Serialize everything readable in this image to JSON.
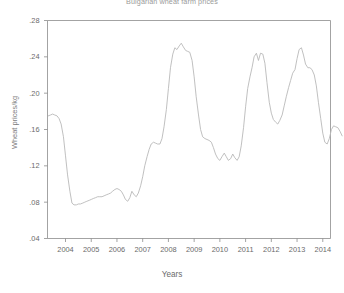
{
  "chart_data": {
    "type": "line",
    "title": "Bulgarian wheat farm prices",
    "xlabel": "Years",
    "ylabel": "Wheat prices/kg",
    "grid": false,
    "legend": false,
    "xlim": [
      2003.3,
      2014.3
    ],
    "ylim": [
      0.04,
      0.28
    ],
    "yticks": [
      0.04,
      0.08,
      0.12,
      0.16,
      0.2,
      0.24,
      0.28
    ],
    "ytick_labels": [
      ".04",
      ".08",
      ".12",
      ".16",
      ".20",
      ".24",
      ".28"
    ],
    "xticks": [
      2004,
      2005,
      2006,
      2007,
      2008,
      2009,
      2010,
      2011,
      2012,
      2013,
      2014
    ],
    "xtick_labels": [
      "2004",
      "2005",
      "2006",
      "2007",
      "2008",
      "2009",
      "2010",
      "2011",
      "2012",
      "2013",
      "2014"
    ],
    "line_color": "#b9b9b9",
    "axis_color": "#8c8c8c",
    "background": "#ffffff",
    "series": [
      {
        "name": "Wheat price per kg",
        "x": [
          2003.33,
          2003.42,
          2003.5,
          2003.58,
          2003.67,
          2003.75,
          2003.83,
          2003.92,
          2004.0,
          2004.08,
          2004.17,
          2004.25,
          2004.33,
          2004.42,
          2004.5,
          2004.58,
          2004.67,
          2004.75,
          2004.83,
          2004.92,
          2005.0,
          2005.08,
          2005.17,
          2005.25,
          2005.33,
          2005.42,
          2005.5,
          2005.58,
          2005.67,
          2005.75,
          2005.83,
          2005.92,
          2006.0,
          2006.08,
          2006.17,
          2006.25,
          2006.33,
          2006.42,
          2006.5,
          2006.58,
          2006.67,
          2006.75,
          2006.83,
          2006.92,
          2007.0,
          2007.08,
          2007.17,
          2007.25,
          2007.33,
          2007.42,
          2007.5,
          2007.58,
          2007.67,
          2007.75,
          2007.83,
          2007.92,
          2008.0,
          2008.08,
          2008.17,
          2008.25,
          2008.33,
          2008.42,
          2008.5,
          2008.58,
          2008.67,
          2008.75,
          2008.83,
          2008.92,
          2009.0,
          2009.08,
          2009.17,
          2009.25,
          2009.33,
          2009.42,
          2009.5,
          2009.58,
          2009.67,
          2009.75,
          2009.83,
          2009.92,
          2010.0,
          2010.08,
          2010.17,
          2010.25,
          2010.33,
          2010.42,
          2010.5,
          2010.58,
          2010.67,
          2010.75,
          2010.83,
          2010.92,
          2011.0,
          2011.08,
          2011.17,
          2011.25,
          2011.33,
          2011.42,
          2011.5,
          2011.58,
          2011.67,
          2011.75,
          2011.83,
          2011.92,
          2012.0,
          2012.08,
          2012.17,
          2012.25,
          2012.33,
          2012.42,
          2012.5,
          2012.58,
          2012.67,
          2012.75,
          2012.83,
          2012.92,
          2013.0,
          2013.08,
          2013.17,
          2013.25,
          2013.33,
          2013.42,
          2013.5,
          2013.58,
          2013.67,
          2013.75,
          2013.83,
          2013.92,
          2014.0,
          2014.08,
          2014.17
        ],
        "values": [
          0.175,
          0.176,
          0.177,
          0.176,
          0.175,
          0.172,
          0.166,
          0.152,
          0.131,
          0.11,
          0.092,
          0.079,
          0.077,
          0.077,
          0.078,
          0.078,
          0.079,
          0.08,
          0.081,
          0.082,
          0.083,
          0.084,
          0.085,
          0.086,
          0.086,
          0.086,
          0.087,
          0.088,
          0.089,
          0.09,
          0.092,
          0.094,
          0.095,
          0.094,
          0.092,
          0.088,
          0.083,
          0.081,
          0.085,
          0.092,
          0.088,
          0.086,
          0.09,
          0.098,
          0.108,
          0.12,
          0.13,
          0.138,
          0.144,
          0.146,
          0.145,
          0.144,
          0.144,
          0.15,
          0.163,
          0.182,
          0.205,
          0.228,
          0.243,
          0.25,
          0.248,
          0.252,
          0.255,
          0.251,
          0.247,
          0.246,
          0.245,
          0.236,
          0.218,
          0.196,
          0.176,
          0.16,
          0.152,
          0.15,
          0.149,
          0.148,
          0.146,
          0.14,
          0.133,
          0.128,
          0.126,
          0.13,
          0.134,
          0.13,
          0.126,
          0.128,
          0.133,
          0.129,
          0.126,
          0.13,
          0.142,
          0.162,
          0.185,
          0.205,
          0.218,
          0.228,
          0.24,
          0.244,
          0.236,
          0.244,
          0.243,
          0.233,
          0.212,
          0.19,
          0.178,
          0.171,
          0.168,
          0.166,
          0.17,
          0.176,
          0.186,
          0.196,
          0.206,
          0.214,
          0.222,
          0.226,
          0.238,
          0.248,
          0.25,
          0.242,
          0.232,
          0.228,
          0.228,
          0.226,
          0.22,
          0.208,
          0.19,
          0.172,
          0.156,
          0.146,
          0.144
        ],
        "post_values": [
          0.15,
          0.16,
          0.164,
          0.163,
          0.162,
          0.158,
          0.153
        ]
      }
    ]
  }
}
